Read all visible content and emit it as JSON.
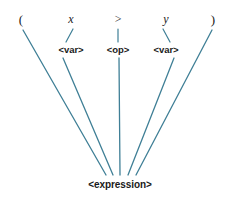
{
  "diagram": {
    "type": "parse-tree",
    "title": "",
    "background_color": "#ffffff",
    "line_color": "#3f7f96",
    "text_color": "#1a1a1a",
    "tokens": [
      {
        "id": "lparen",
        "text": "(",
        "x": 21,
        "y": 19,
        "style": "paren"
      },
      {
        "id": "var-x",
        "text": "x",
        "x": 71,
        "y": 19,
        "style": "italic"
      },
      {
        "id": "op-gt",
        "text": ">",
        "x": 118,
        "y": 19,
        "style": "italic"
      },
      {
        "id": "var-y",
        "text": "y",
        "x": 166,
        "y": 19,
        "style": "italic"
      },
      {
        "id": "rparen",
        "text": ")",
        "x": 213,
        "y": 19,
        "style": "paren"
      }
    ],
    "nonterminals": [
      {
        "id": "var-left",
        "text": "<var>",
        "x": 71,
        "y": 50
      },
      {
        "id": "op-middle",
        "text": "<op>",
        "x": 118,
        "y": 50
      },
      {
        "id": "var-right",
        "text": "<var>",
        "x": 166,
        "y": 50
      }
    ],
    "root": {
      "id": "expression",
      "text": "<expression>",
      "x": 120,
      "y": 185
    },
    "stub_edges": [
      {
        "from": "var-x",
        "to": "var-left",
        "x1": 73,
        "y1": 29,
        "x2": 66,
        "y2": 42
      },
      {
        "from": "op-gt",
        "to": "op-middle",
        "x1": 118,
        "y1": 29,
        "x2": 118,
        "y2": 42
      },
      {
        "from": "var-y",
        "to": "var-right",
        "x1": 163,
        "y1": 29,
        "x2": 170,
        "y2": 42
      }
    ],
    "tree_edges": [
      {
        "from": "lparen",
        "to": "expression",
        "x1": 23,
        "y1": 30,
        "x2": 106,
        "y2": 175
      },
      {
        "from": "var-left",
        "to": "expression",
        "x1": 63,
        "y1": 58,
        "x2": 113,
        "y2": 175
      },
      {
        "from": "op-middle",
        "to": "expression",
        "x1": 119,
        "y1": 58,
        "x2": 120,
        "y2": 175
      },
      {
        "from": "var-right",
        "to": "expression",
        "x1": 174,
        "y1": 58,
        "x2": 128,
        "y2": 175
      },
      {
        "from": "rparen",
        "to": "expression",
        "x1": 212,
        "y1": 30,
        "x2": 136,
        "y2": 175
      }
    ]
  }
}
